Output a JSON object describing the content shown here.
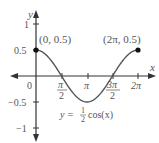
{
  "chart_data": {
    "type": "line",
    "title": "",
    "equation": "y = ½cos(x)",
    "equation_parts": {
      "lhs": "y =",
      "frac_num": "1",
      "frac_den": "2",
      "rhs": "cos(x)"
    },
    "xlabel": "x",
    "ylabel": "y",
    "x_ticks": [
      "π/2",
      "π",
      "3π/2",
      "2π"
    ],
    "x_tick_values": [
      1.5708,
      3.1416,
      4.7124,
      6.2832
    ],
    "y_ticks": [
      "1",
      "0.5",
      "0",
      "−0.5",
      "−1"
    ],
    "y_tick_values": [
      1,
      0.5,
      0,
      -0.5,
      -1
    ],
    "origin_label": "0",
    "xlim": [
      -1.6,
      7.2
    ],
    "ylim": [
      -1.25,
      1.25
    ],
    "grid": false,
    "series": [
      {
        "name": "y = ½cos(x)",
        "function": "0.5*cos(x)",
        "domain": [
          0,
          6.2832
        ],
        "x": [
          0,
          0.7854,
          1.5708,
          2.3562,
          3.1416,
          3.927,
          4.7124,
          5.4978,
          6.2832
        ],
        "values": [
          0.5,
          0.354,
          0,
          -0.354,
          -0.5,
          -0.354,
          0,
          0.354,
          0.5
        ]
      }
    ],
    "annotations": [
      {
        "label": "(0, 0.5)",
        "x": 0,
        "y": 0.5,
        "marker": "filled-dot"
      },
      {
        "label": "(2π, 0.5)",
        "x": 6.2832,
        "y": 0.5,
        "marker": "filled-dot"
      }
    ],
    "colors": {
      "axis": "#333333",
      "curve": "#555555",
      "text": "#555555"
    }
  },
  "labels": {
    "y_axis": "y",
    "x_axis": "x",
    "y_1": "1",
    "y_05": "0.5",
    "y_0": "0",
    "y_m05": "−0.5",
    "y_m1": "−1",
    "x_pi": "π",
    "x_2pi": "2π",
    "x_pi2_num": "π",
    "x_pi2_den": "2",
    "x_3pi2_num": "3π",
    "x_3pi2_den": "2",
    "pt_start": "(0, 0.5)",
    "pt_end": "(2π, 0.5)",
    "eq_lhs": "y =",
    "eq_num": "1",
    "eq_den": "2",
    "eq_rhs": "cos(x)"
  }
}
